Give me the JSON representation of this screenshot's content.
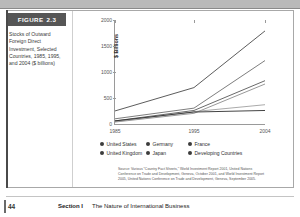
{
  "figure": {
    "tab_label": "FIGURE",
    "tab_number": "2.3",
    "caption": "Stocks of Outward Foreign Direct Investment, Selected Countries, 1985, 1995, and 2004 ($ billions)"
  },
  "source": {
    "line1": "Source: Various \"Country Fact Sheets,\" World Investment Report 2001, United Nations",
    "line2": "Conference on Trade and Development, Geneva, October 2001, and World Investment Report",
    "line3": "2005, United Nations Conference on Trade and Development, Geneva, September 2005."
  },
  "legend": {
    "items": [
      {
        "label": "United States",
        "color": "#3c3c3c"
      },
      {
        "label": "Germany",
        "color": "#3c3c3c"
      },
      {
        "label": "France",
        "color": "#3c3c3c"
      },
      {
        "label": "United Kingdom",
        "color": "#3c3c3c"
      },
      {
        "label": "Japan",
        "color": "#3c3c3c"
      },
      {
        "label": "Developing Countries",
        "color": "#3c3c3c"
      }
    ]
  },
  "footer": {
    "page_number": "44",
    "section": "Section I",
    "section_title": "The Nature of International Business"
  },
  "chart_data": {
    "type": "line",
    "title": "",
    "xlabel": "",
    "ylabel": "$ Billions",
    "categories": [
      "1985",
      "1995",
      "2004"
    ],
    "x": [
      1985,
      1995,
      2004
    ],
    "ylim": [
      0,
      2000
    ],
    "yticks": [
      0,
      500,
      1000,
      1500,
      2000
    ],
    "grid": false,
    "legend_position": "bottom",
    "series": [
      {
        "name": "United States",
        "values": [
          251,
          700,
          1790
        ]
      },
      {
        "name": "United Kingdom",
        "values": [
          100,
          305,
          1220
        ]
      },
      {
        "name": "Germany",
        "values": [
          60,
          260,
          833
        ]
      },
      {
        "name": "France",
        "values": [
          38,
          205,
          769
        ]
      },
      {
        "name": "Japan",
        "values": [
          44,
          238,
          371
        ]
      },
      {
        "name": "Developing Countries",
        "values": [
          60,
          230,
          260
        ]
      }
    ]
  }
}
